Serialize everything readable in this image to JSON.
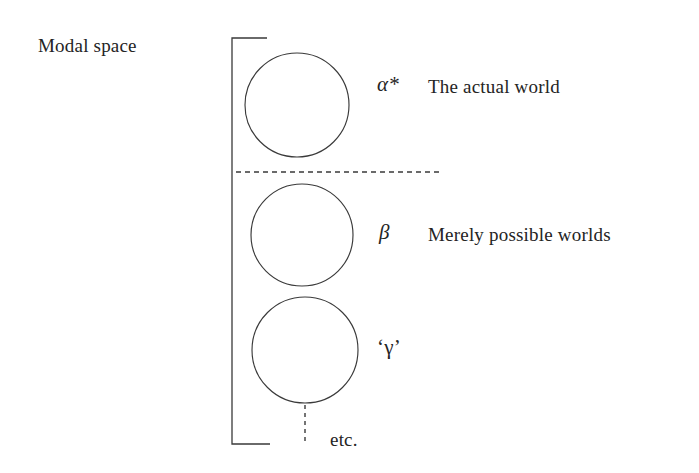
{
  "diagram": {
    "title_label": "Modal space",
    "etc_label": "etc.",
    "stroke_color": "#3a3a3a",
    "text_color": "#242424",
    "background_color": "#ffffff",
    "worlds": [
      {
        "symbol": "α*",
        "description": "The actual world",
        "circle": {
          "cx": 297,
          "cy": 105,
          "r": 52
        }
      },
      {
        "symbol": "β",
        "description": "Merely possible worlds",
        "circle": {
          "cx": 302,
          "cy": 235,
          "r": 51
        }
      },
      {
        "symbol": "‘γ’",
        "description": "",
        "circle": {
          "cx": 305,
          "cy": 350,
          "r": 53
        }
      }
    ],
    "bracket": {
      "x": 232,
      "top": 38,
      "bottom": 444,
      "arm_top_end": 267,
      "arm_bottom_end": 270
    },
    "divider": {
      "y": 172,
      "x_start": 236,
      "x_end": 442
    },
    "stem": {
      "x": 305,
      "y_start": 405,
      "y_end": 445
    }
  }
}
